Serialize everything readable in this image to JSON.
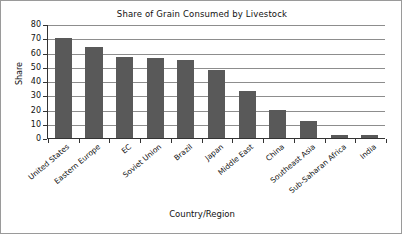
{
  "chart_data": {
    "type": "bar",
    "title": "Share of Grain Consumed by Livestock",
    "xlabel": "Country/Region",
    "ylabel": "Share",
    "ylim": [
      0,
      80
    ],
    "ytick_step": 10,
    "grid": true,
    "legend": null,
    "bar_color": "#595959",
    "categories": [
      "United States",
      "Eastern Europe",
      "EC",
      "Soviet Union",
      "Brazil",
      "Japan",
      "Middle East",
      "China",
      "Southeast Asia",
      "Sub-Saharan Africa",
      "India"
    ],
    "values": [
      70,
      64,
      57,
      56,
      55,
      48,
      33,
      20,
      12,
      2,
      2
    ],
    "ytick_labels": [
      "80",
      "70",
      "60",
      "50",
      "40",
      "30",
      "20",
      "10",
      "0"
    ]
  }
}
